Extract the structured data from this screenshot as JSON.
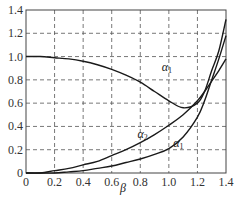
{
  "chart_data": {
    "type": "line",
    "title": "",
    "xlabel": "β",
    "ylabel": "",
    "xlim": [
      0,
      1.4
    ],
    "ylim": [
      0,
      1.4
    ],
    "grid": true,
    "grid_style": "dashed",
    "x_ticks": [
      "0",
      "0.2",
      "0.4",
      "0.6",
      "0.8",
      "1.0",
      "1.2",
      "1.4"
    ],
    "y_ticks": [
      "0",
      "0.2",
      "0.4",
      "0.6",
      "0.8",
      "1.0",
      "1.2",
      "1.4"
    ],
    "x": [
      0,
      0.1,
      0.2,
      0.3,
      0.4,
      0.5,
      0.6,
      0.7,
      0.8,
      0.9,
      1.0,
      1.1,
      1.2,
      1.25,
      1.3,
      1.35,
      1.4
    ],
    "series": [
      {
        "name": "α1 (upper)",
        "label": "α1",
        "values": [
          1.0,
          1.0,
          0.99,
          0.98,
          0.96,
          0.93,
          0.89,
          0.84,
          0.78,
          0.7,
          0.62,
          0.56,
          0.6,
          0.7,
          0.88,
          1.05,
          1.32
        ]
      },
      {
        "name": "α2",
        "label": "α2",
        "values": [
          0,
          0,
          0.02,
          0.04,
          0.07,
          0.1,
          0.15,
          0.2,
          0.26,
          0.33,
          0.41,
          0.5,
          0.62,
          0.7,
          0.79,
          0.88,
          0.98
        ]
      },
      {
        "name": "α1 (lower)",
        "label": "α1",
        "values": [
          0,
          0,
          0,
          0.01,
          0.02,
          0.04,
          0.06,
          0.09,
          0.12,
          0.16,
          0.21,
          0.31,
          0.48,
          0.62,
          0.8,
          0.98,
          1.18
        ]
      }
    ],
    "annotations": [
      {
        "text": "α1",
        "x": 0.95,
        "y": 0.88
      },
      {
        "text": "α2",
        "x": 0.78,
        "y": 0.3
      },
      {
        "text": "α1",
        "x": 1.03,
        "y": 0.22
      }
    ]
  }
}
